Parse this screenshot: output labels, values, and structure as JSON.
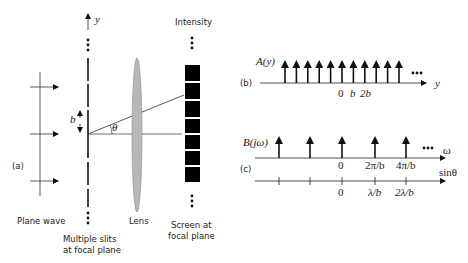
{
  "panel_a": {
    "label": "(a)",
    "y_axis_label": "y",
    "intensity_label": "Intensity",
    "b_label": "b",
    "theta_label": "θ",
    "plane_wave_label": "Plane wave",
    "lens_label": "Lens",
    "slits_label_line1": "Multiple slits",
    "slits_label_line2": "at focal plane",
    "screen_label_line1": "Screen at",
    "screen_label_line2": "focal plane"
  },
  "panel_b": {
    "label": "(b)",
    "function_label": "A(y)",
    "axis_label": "y",
    "tick_labels": [
      "0",
      "b",
      "2b"
    ]
  },
  "panel_c": {
    "label": "(c)",
    "function_label": "B(jω)",
    "omega_axis_label": "ω",
    "sin_axis_label": "sinθ",
    "omega_tick_labels": [
      "0",
      "2π/b",
      "4π/b"
    ],
    "sin_tick_labels": [
      "0",
      "λ/b",
      "2λ/b"
    ]
  },
  "colors": {
    "ink": "#111111",
    "lens_fill": "#b8b8b8",
    "lens_stroke": "#8a8a8a"
  }
}
